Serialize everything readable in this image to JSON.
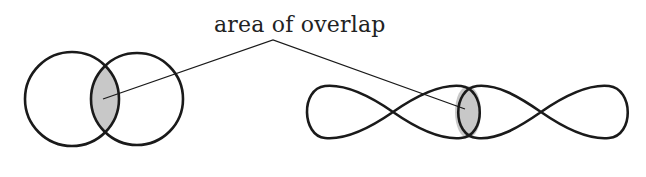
{
  "diagram": {
    "label": "area of overlap",
    "colors": {
      "stroke": "#1a1a1a",
      "overlap_fill": "#c8c8c8",
      "background": "#ffffff"
    },
    "left_figure": {
      "type": "two overlapping circles",
      "circles": [
        {
          "cx": 72,
          "cy": 99,
          "r": 47
        },
        {
          "cx": 137,
          "cy": 99,
          "r": 46
        }
      ]
    },
    "right_figure": {
      "type": "two overlapping figure-eight loops"
    }
  }
}
